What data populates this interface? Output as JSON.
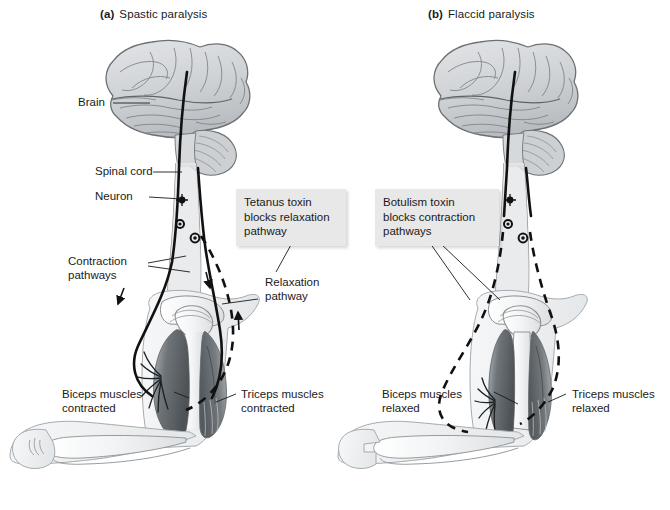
{
  "figure": {
    "background_color": "#ffffff",
    "width": 670,
    "height": 510
  },
  "panels": [
    {
      "tag": "(a)",
      "title": "Spastic paralysis",
      "callout": {
        "text": "Tetanus toxin\nblocks relaxation\npathway",
        "background_color": "#e8e8e8"
      },
      "labels": {
        "brain": "Brain",
        "spinal_cord": "Spinal cord",
        "neuron": "Neuron",
        "contraction_pathways": "Contraction\npathways",
        "relaxation_pathway": "Relaxation\npathway",
        "biceps": "Biceps muscles\ncontracted",
        "triceps": "Triceps muscles\ncontracted"
      }
    },
    {
      "tag": "(b)",
      "title": "Flaccid paralysis",
      "callout": {
        "text": "Botulism toxin\nblocks contraction\npathways",
        "background_color": "#e8e8e8"
      },
      "labels": {
        "biceps": "Biceps muscles\nrelaxed",
        "triceps": "Triceps muscles\nrelaxed"
      }
    }
  ],
  "colors": {
    "ink": "#1a1a1a",
    "brain_fill": "#d2d4d6",
    "brain_stroke": "#6d7174",
    "arm_fill": "#eceef0",
    "arm_stroke": "#8b9094",
    "muscle_dark": "#6f7478",
    "muscle_mid": "#9aa0a4",
    "bone_fill": "#f3f4f5",
    "pathway_solid": "#111111",
    "pathway_dashed": "#111111"
  }
}
